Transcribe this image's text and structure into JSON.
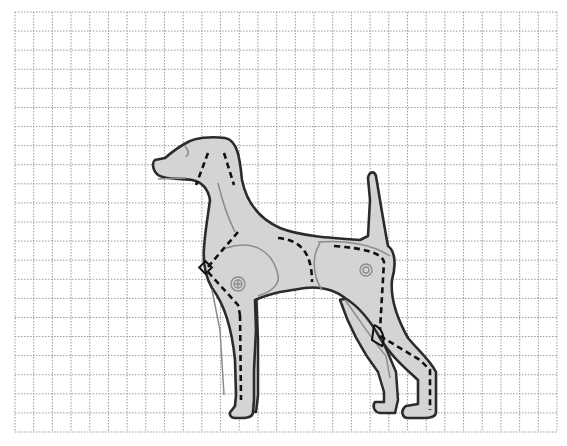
{
  "diagram": {
    "grid": {
      "x0": 15,
      "y0": 12,
      "x1": 557,
      "y1": 432,
      "cols": 29,
      "rows": 22,
      "line_color": "#9a9a9a",
      "style": "dotted"
    },
    "colors": {
      "body_fill": "#d4d4d4",
      "outline": "#2b2b2b",
      "detail_lines": "#8c8c8c",
      "dashed_lines": "#111111",
      "background": "#ffffff"
    },
    "annotations": [
      {
        "name": "neck-angle-lines",
        "style": "dashed"
      },
      {
        "name": "shoulder-angle-marker",
        "style": "diamond"
      },
      {
        "name": "front-leg-axis",
        "style": "dashed"
      },
      {
        "name": "hip-curve",
        "style": "dashed"
      },
      {
        "name": "rear-leg-axis",
        "style": "dashed"
      },
      {
        "name": "hock-angle-marker",
        "style": "angle"
      },
      {
        "name": "shoulder-joint",
        "style": "circle-plus"
      },
      {
        "name": "hip-joint",
        "style": "circle"
      }
    ]
  }
}
